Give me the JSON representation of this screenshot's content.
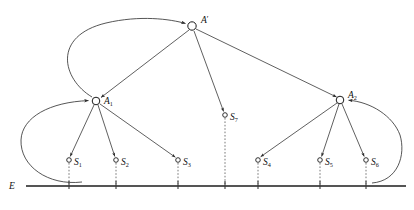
{
  "figure": {
    "type": "hierarchical-agent-tree-diagram",
    "background_color": "#ffffff",
    "line_color": "#2b2b2b",
    "baseline_color": "#555555",
    "node_fill": "#ffffff"
  },
  "labels": {
    "root": {
      "base": "A",
      "prime": "′"
    },
    "agent1": {
      "base": "A",
      "sub": "1"
    },
    "agent2": {
      "base": "A",
      "sub": "2"
    },
    "environment": "E"
  },
  "nodes": {
    "root": {
      "name": "A'",
      "x": 192,
      "y": 26,
      "r": 4.2,
      "label_dx": 9,
      "label_dy": -3
    },
    "agent1": {
      "name": "A1",
      "x": 96,
      "y": 101,
      "r": 3.8,
      "label_dx": 8,
      "label_dy": 3
    },
    "agent2": {
      "name": "A2",
      "x": 340,
      "y": 100,
      "r": 3.8,
      "label_dx": 8,
      "label_dy": -2
    },
    "sensors": [
      {
        "name": "S1",
        "base": "S",
        "sub": "1",
        "x": 69,
        "y": 160,
        "r": 2.3,
        "label_dx": 5,
        "label_dy": 4,
        "tick_x": 69
      },
      {
        "name": "S2",
        "base": "S",
        "sub": "2",
        "x": 116,
        "y": 160,
        "r": 2.3,
        "label_dx": 5,
        "label_dy": 4,
        "tick_x": 116
      },
      {
        "name": "S3",
        "base": "S",
        "sub": "3",
        "x": 178,
        "y": 160,
        "r": 2.3,
        "label_dx": 5,
        "label_dy": 4,
        "tick_x": 178
      },
      {
        "name": "S7",
        "base": "S",
        "sub": "7",
        "x": 225,
        "y": 115,
        "r": 2.3,
        "label_dx": 5,
        "label_dy": 4,
        "tick_x": 225
      },
      {
        "name": "S4",
        "base": "S",
        "sub": "4",
        "x": 258,
        "y": 160,
        "r": 2.3,
        "label_dx": 5,
        "label_dy": 4,
        "tick_x": 258
      },
      {
        "name": "S5",
        "base": "S",
        "sub": "5",
        "x": 320,
        "y": 160,
        "r": 2.3,
        "label_dx": 5,
        "label_dy": 4,
        "tick_x": 320
      },
      {
        "name": "S6",
        "base": "S",
        "sub": "6",
        "x": 366,
        "y": 160,
        "r": 2.3,
        "label_dx": 5,
        "label_dy": 4,
        "tick_x": 366
      }
    ]
  },
  "edges": {
    "straight": [
      {
        "id": "root-to-agent1",
        "from": "A'",
        "to": "A1",
        "x1": 189,
        "y1": 30,
        "x2": 100,
        "y2": 97
      },
      {
        "id": "root-to-s7",
        "from": "A'",
        "to": "S7",
        "x1": 194,
        "y1": 31,
        "x2": 223,
        "y2": 111
      },
      {
        "id": "root-to-agent2",
        "from": "A'",
        "to": "A2",
        "x1": 196,
        "y1": 29,
        "x2": 337,
        "y2": 97
      },
      {
        "id": "agent1-to-s1",
        "from": "A1",
        "to": "S1",
        "x1": 94,
        "y1": 105,
        "x2": 70,
        "y2": 156
      },
      {
        "id": "agent1-to-s2",
        "from": "A1",
        "to": "S2",
        "x1": 98,
        "y1": 105,
        "x2": 114,
        "y2": 156
      },
      {
        "id": "agent1-to-s3",
        "from": "A1",
        "to": "S3",
        "x1": 100,
        "y1": 104,
        "x2": 175,
        "y2": 157
      },
      {
        "id": "agent2-to-s4",
        "from": "A2",
        "to": "S4",
        "x1": 337,
        "y1": 103,
        "x2": 261,
        "y2": 156
      },
      {
        "id": "agent2-to-s5",
        "from": "A2",
        "to": "S5",
        "x1": 339,
        "y1": 104,
        "x2": 322,
        "y2": 156
      },
      {
        "id": "agent2-to-s6",
        "from": "A2",
        "to": "S6",
        "x1": 342,
        "y1": 104,
        "x2": 364,
        "y2": 156
      }
    ],
    "curved": [
      {
        "id": "agent1-to-root-feedback",
        "from": "A1",
        "to": "A'",
        "path": "M 93 98 C 60 80, 54 38, 105 24 C 140 15, 170 19, 186 24"
      },
      {
        "id": "environment-to-agent1-feedback",
        "from": "E",
        "to": "A1",
        "path": "M 79 182 C 50 186, 22 168, 22 140 C 22 118, 48 103, 89 101"
      },
      {
        "id": "environment-to-agent2-feedback",
        "from": "E",
        "to": "A2",
        "path": "M 374 182 C 396 180, 404 156, 399 136 C 394 118, 370 103, 350 101"
      }
    ]
  },
  "baseline": {
    "y": 186,
    "x_start": 26,
    "x_end": 406,
    "label": "E",
    "label_x": 12,
    "label_y": 189
  },
  "ticks": {
    "extent_up": 5,
    "extent_down": 3
  }
}
